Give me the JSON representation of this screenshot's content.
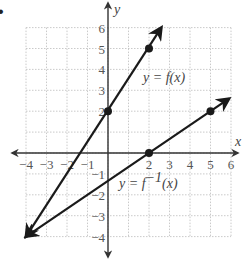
{
  "bullet": "•",
  "chart_data": {
    "type": "line",
    "title": "",
    "xlabel": "x",
    "ylabel": "y",
    "xlim": [
      -4,
      6
    ],
    "ylim": [
      -4,
      6
    ],
    "grid": true,
    "x_ticks": [
      -4,
      -3,
      -2,
      -1,
      2,
      3,
      4,
      5,
      6
    ],
    "y_ticks": [
      6,
      5,
      4,
      3,
      2,
      -1,
      -2,
      -3,
      -4
    ],
    "x_tick_labels": [
      "−4",
      "−3",
      "−2",
      "−1",
      "2",
      "3",
      "4",
      "5",
      "6"
    ],
    "y_tick_labels": [
      "6",
      "5",
      "4",
      "3",
      "2",
      "−1",
      "−2",
      "−3",
      "−4"
    ],
    "series": [
      {
        "name": "y = f(x)",
        "label_parts": {
          "lhs": "y = ",
          "fn": "f",
          "arg": "(x)"
        },
        "points": [
          [
            0,
            2
          ],
          [
            2,
            5
          ]
        ],
        "line_extent": [
          [
            -4,
            -4
          ],
          [
            2.6,
            6.0
          ]
        ],
        "arrows": "both"
      },
      {
        "name": "y = f⁻¹(x)",
        "label_parts": {
          "lhs": "y = ",
          "fn": "f",
          "sup": "−1",
          "arg": "(x)"
        },
        "points": [
          [
            2,
            0
          ],
          [
            5,
            2
          ]
        ],
        "line_extent": [
          [
            -4,
            -4
          ],
          [
            5.9,
            2.6
          ]
        ],
        "arrows": "both"
      }
    ],
    "colors": {
      "line": "#1a1a1a",
      "grid": "#bdbdbd",
      "axis": "#333333",
      "text": "#555555"
    }
  }
}
